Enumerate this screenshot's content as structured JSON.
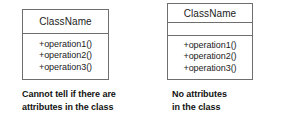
{
  "figure": {
    "kind": "uml-class-diagram-comparison",
    "background_color": "#ffffff",
    "line_color": "#6e6e6e",
    "text_color": "#1b1b1b"
  },
  "left_example": {
    "class_name": "ClassName",
    "attributes_compartment_shown": false,
    "operations": [
      "+operation1()",
      "+operation2()",
      "+operation3()"
    ],
    "caption_line_1": "Cannot tell if there are",
    "caption_line_2": "attributes in the class"
  },
  "right_example": {
    "class_name": "ClassName",
    "attributes_compartment_shown": true,
    "attributes": [],
    "operations": [
      "+operation1()",
      "+operation2()",
      "+operation3()"
    ],
    "caption_line_1": "No attributes",
    "caption_line_2": "in the class"
  }
}
